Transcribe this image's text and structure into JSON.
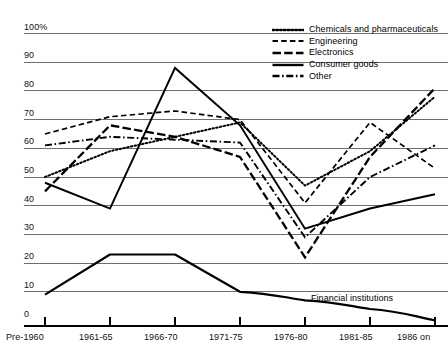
{
  "chart_data": {
    "type": "line",
    "title": "",
    "subtitle": "",
    "xlabel": "",
    "ylabel": "",
    "ylim": [
      0,
      100
    ],
    "y_unit": "100%",
    "grid": true,
    "grid_axis": "y",
    "legend_position": "top-right",
    "categories": [
      "Pre-1960",
      "1961-65",
      "1966-70",
      "1971-75",
      "1976-80",
      "1981-85",
      "1986 on"
    ],
    "ytick_labels": [
      "0",
      "10",
      "20",
      "30",
      "40",
      "50",
      "60",
      "70",
      "80",
      "90",
      "100%"
    ],
    "ytick_values": [
      0,
      10,
      20,
      30,
      40,
      50,
      60,
      70,
      80,
      90,
      100
    ],
    "series": [
      {
        "name": "Chemicals and pharmaceuticals",
        "style": "dotted",
        "values": [
          50,
          59,
          64,
          69,
          47,
          59,
          78
        ]
      },
      {
        "name": "Engineering",
        "style": "dashed",
        "values": [
          65,
          71,
          73,
          70,
          41,
          69,
          53
        ]
      },
      {
        "name": "Electronics",
        "style": "long-dash",
        "values": [
          45,
          68,
          64,
          57,
          22,
          57,
          81
        ]
      },
      {
        "name": "Consumer goods",
        "style": "solid",
        "values": [
          48,
          39,
          88,
          68,
          32,
          39,
          44
        ]
      },
      {
        "name": "Other",
        "style": "dash-dot",
        "values": [
          61,
          64,
          63,
          62,
          29,
          50,
          61
        ]
      }
    ],
    "annotated_series": [
      {
        "name": "Financial institutions",
        "style": "solid",
        "label": "Financial institutions",
        "values": [
          9,
          23,
          23,
          10,
          7,
          4,
          0
        ]
      }
    ]
  },
  "legend": {
    "items": [
      {
        "label": "Chemicals and pharmaceuticals",
        "style": "dotted"
      },
      {
        "label": "Engineering",
        "style": "dashed"
      },
      {
        "label": "Electronics",
        "style": "long-dash"
      },
      {
        "label": "Consumer goods",
        "style": "solid"
      },
      {
        "label": "Other",
        "style": "dash-dot"
      }
    ]
  },
  "colors": {
    "line": "#000000",
    "grid": "#6e6e6e",
    "axis": "#000000",
    "background": "#ffffff",
    "text": "#111111"
  }
}
